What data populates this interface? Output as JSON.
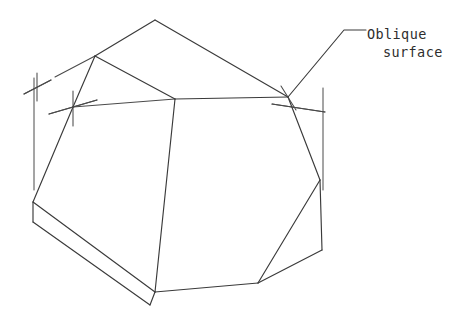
{
  "drawing": {
    "title": "Oblique surface pictorial",
    "background_color": "#ffffff",
    "line_color": "#3a3a3a",
    "construction_color": "#4a4a4a",
    "text_color": "#2e2e2e",
    "width": 466,
    "height": 314
  },
  "annotation": {
    "label_line_1": "Oblique",
    "label_line_2": "surface",
    "leader": {
      "name": "leader-line",
      "points": "288,97 344,30 366,30"
    }
  },
  "markers": [
    {
      "name": "cross-marker-left",
      "cx": 37,
      "cy": 87,
      "arm1": "24,94 51,80",
      "arm2": "37,73 37,101"
    },
    {
      "name": "cross-marker-center",
      "cx": 73,
      "cy": 107,
      "arm1": "49,114 97,100",
      "arm2": "73,91 73,126"
    },
    {
      "name": "cross-marker-right",
      "cx": 288,
      "cy": 97,
      "arm1": "272,104 325,112",
      "arm2": "281,86 296,110"
    }
  ],
  "extension_lines": [
    {
      "name": "extension-line-left",
      "d": "M 34 78 L 34 190"
    },
    {
      "name": "extension-line-right",
      "d": "M 323 88 L 323 190"
    }
  ],
  "construction_lines": [
    {
      "name": "construction-line-upper-left",
      "d": "M 24 94 L 51 80"
    },
    {
      "name": "construction-line-top-left-diagonal",
      "d": "M 49 114 L 97 100"
    },
    {
      "name": "construction-line-center-span",
      "d": "M 73 107 L 175 99"
    },
    {
      "name": "construction-line-right-span",
      "d": "M 272 104 L 325 112"
    },
    {
      "name": "construction-line-edge-extend",
      "d": "M 55 77 L 95 56"
    }
  ],
  "solid": {
    "name": "polyhedral-solid",
    "faces": [
      {
        "name": "face-top-rear",
        "points": "95,56 155,20 288,97 175,99"
      },
      {
        "name": "face-oblique-left",
        "points": "95,56 175,99 73,107"
      },
      {
        "name": "face-front-left",
        "points": "73,107 175,99 155,292 33,202"
      },
      {
        "name": "face-front-right",
        "points": "175,99 288,97 320,180 258,283 155,292"
      },
      {
        "name": "face-right-side",
        "points": "288,97 320,180 322,250 258,283"
      },
      {
        "name": "face-bottom-chamfer",
        "points": "33,202 155,292 150,305 33,222"
      }
    ],
    "edges": [
      {
        "name": "edge-top-apex-left",
        "d": "M 95 56 L 155 20"
      },
      {
        "name": "edge-top-apex-right",
        "d": "M 155 20 L 288 97"
      },
      {
        "name": "edge-top-rear-front",
        "d": "M 95 56 L 175 99"
      },
      {
        "name": "edge-top-center-right",
        "d": "M 175 99 L 288 97"
      },
      {
        "name": "edge-oblique-left-lower",
        "d": "M 95 56 L 73 107"
      },
      {
        "name": "edge-left-vertical",
        "d": "M 73 107 L 33 202"
      },
      {
        "name": "edge-center-vertical",
        "d": "M 175 99 L 155 292"
      },
      {
        "name": "edge-right-upper",
        "d": "M 288 97 L 320 180"
      },
      {
        "name": "edge-right-lower",
        "d": "M 320 180 L 322 250"
      },
      {
        "name": "edge-right-bottom-diag",
        "d": "M 320 180 L 258 283"
      },
      {
        "name": "edge-bottom-right-corner",
        "d": "M 322 250 L 258 283"
      },
      {
        "name": "edge-bottom-front",
        "d": "M 155 292 L 258 283"
      },
      {
        "name": "edge-chamfer-top",
        "d": "M 33 202 L 155 292"
      },
      {
        "name": "edge-chamfer-left-drop",
        "d": "M 33 202 L 33 222"
      },
      {
        "name": "edge-chamfer-bottom",
        "d": "M 33 222 L 150 305"
      },
      {
        "name": "edge-chamfer-right-close",
        "d": "M 150 305 L 155 292"
      }
    ]
  }
}
